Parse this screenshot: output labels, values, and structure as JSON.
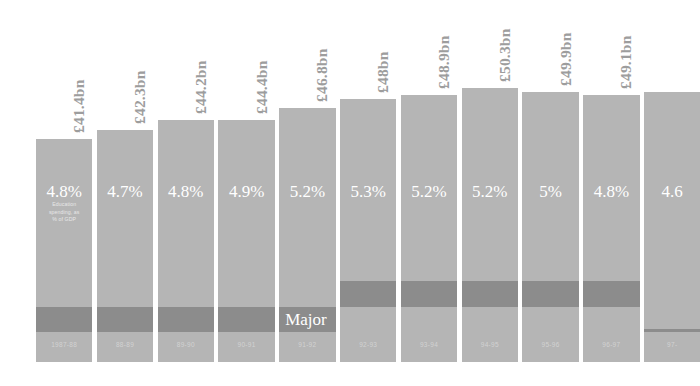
{
  "chart_data": {
    "type": "bar",
    "title": "",
    "subtitle": "",
    "xlabel": "",
    "ylabel": "",
    "grid": false,
    "legend_position": "none",
    "value_caption": [
      "Education",
      "spending, as",
      "% of GDP"
    ],
    "categories": [
      "1987-88",
      "88-89",
      "89-90",
      "90-91",
      "91-92",
      "92-93",
      "93-94",
      "94-95",
      "95-96",
      "96-97",
      "97-"
    ],
    "series": [
      {
        "name": "Education spending (£bn)",
        "value_labels": [
          "£41.4bn",
          "£42.3bn",
          "£44.2bn",
          "£44.4bn",
          "£46.8bn",
          "£48bn",
          "£48.9bn",
          "£50.3bn",
          "£49.9bn",
          "£49.1bn",
          ""
        ],
        "values": [
          41.4,
          42.3,
          44.2,
          44.4,
          46.8,
          48.0,
          48.9,
          50.3,
          49.9,
          49.1,
          null
        ]
      },
      {
        "name": "Education spending, as % of GDP",
        "value_labels": [
          "4.8%",
          "4.7%",
          "4.8%",
          "4.9%",
          "5.2%",
          "5.3%",
          "5.2%",
          "5.2%",
          "5%",
          "4.8%",
          "4.6"
        ],
        "values": [
          4.8,
          4.7,
          4.8,
          4.9,
          5.2,
          5.3,
          5.2,
          5.2,
          5.0,
          4.8,
          4.6
        ]
      }
    ],
    "prime_ministers": [
      {
        "label": "Thatcher",
        "start_index": 0,
        "end_index": 4
      },
      {
        "label": "Major",
        "start_index": 4,
        "end_index": 9
      },
      {
        "label": "Blair",
        "start_index": 10,
        "end_index": 10
      }
    ],
    "colors": {
      "bar": "#b5b5b5",
      "band": "#8c8c8c",
      "value_label": "#9d9d9d",
      "percent_text": "#ffffff",
      "year_text": "#d2d2d2",
      "background": "#ffffff"
    }
  }
}
